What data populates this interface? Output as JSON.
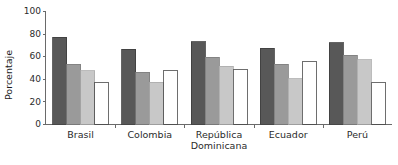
{
  "chart_data": {
    "type": "bar",
    "title": "",
    "xlabel": "",
    "ylabel": "Porcentaje",
    "ylim": [
      0,
      100
    ],
    "yticks": [
      0,
      20,
      40,
      60,
      80,
      100
    ],
    "grid": false,
    "legend": "none",
    "categories": [
      "Brasil",
      "Colombia",
      "República Dominicana",
      "Ecuador",
      "Perú"
    ],
    "category_lines": [
      [
        "Brasil"
      ],
      [
        "Colombia"
      ],
      [
        "República",
        "Dominicana"
      ],
      [
        "Ecuador"
      ],
      [
        "Perú"
      ]
    ],
    "series": [
      {
        "name": "serie-1",
        "color": "#585858",
        "stroke": "#3d3d3d",
        "values": [
          77,
          66,
          73,
          67,
          72
        ]
      },
      {
        "name": "serie-2",
        "color": "#9a9a9a",
        "stroke": "#7d7d7d",
        "values": [
          53,
          46,
          59,
          53,
          61
        ]
      },
      {
        "name": "serie-3",
        "color": "#c8c8c8",
        "stroke": "#ababab",
        "values": [
          47,
          37,
          51,
          40,
          57
        ]
      },
      {
        "name": "serie-4",
        "color": "#ffffff",
        "stroke": "#4a4a4a",
        "values": [
          37,
          47,
          48,
          55,
          37
        ]
      }
    ]
  },
  "axis": {
    "y_title": "Porcentaje",
    "y_tick_labels": [
      "100",
      "80",
      "60",
      "40",
      "20",
      "0"
    ]
  }
}
